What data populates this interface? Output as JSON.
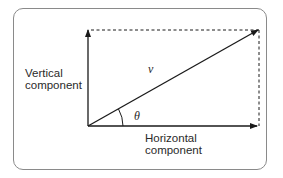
{
  "diagram": {
    "type": "vector-components",
    "labels": {
      "vertical_line1": "Vertical",
      "vertical_line2": "component",
      "horizontal_line1": "Horizontal",
      "horizontal_line2": "component",
      "vector": "v",
      "angle": "θ"
    },
    "colors": {
      "stroke": "#1a1a1a",
      "frame": "#8a8a8a",
      "text": "#2a2a2a"
    }
  }
}
